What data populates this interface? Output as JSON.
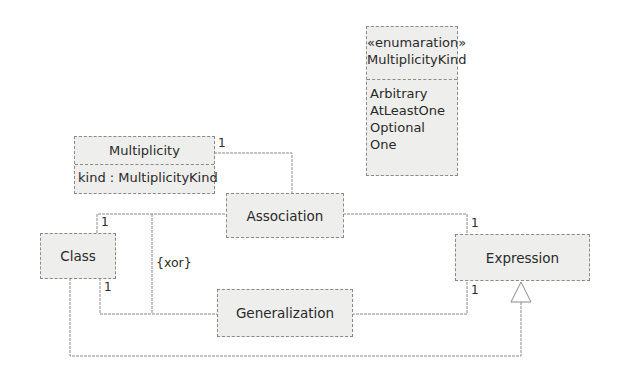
{
  "diagram": {
    "type": "UML class diagram",
    "classes": {
      "enum": {
        "stereotype": "«enumaration»",
        "name": "MultiplicityKind",
        "literals": [
          "Arbitrary",
          "AtLeastOne",
          "Optional",
          "One"
        ]
      },
      "multiplicity": {
        "name": "Multiplicity",
        "attribute": "kind : MultiplicityKind"
      },
      "association": {
        "name": "Association"
      },
      "class": {
        "name": "Class"
      },
      "expression": {
        "name": "Expression"
      },
      "generalization": {
        "name": "Generalization"
      }
    },
    "constraints": {
      "xor": "{xor}"
    },
    "multiplicities": {
      "multiplicity_end": "1",
      "class_association_end": "1",
      "class_generalization_end": "1",
      "expression_association_end": "1",
      "expression_generalization_end": "1"
    },
    "colors": {
      "box_fill": "#eeeeec",
      "line": "#8a8a8a",
      "text": "#2a2a2a"
    }
  }
}
